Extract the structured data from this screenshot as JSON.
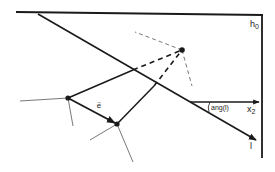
{
  "diagram": {
    "labels": {
      "h0": "h",
      "h0_sub": "0",
      "x2": "x",
      "x2_sub": "2",
      "line_l": "l",
      "angle": "ang(l)",
      "vector_e": "e",
      "vector_arrow": "→"
    },
    "colors": {
      "ink": "#1a1a1a",
      "thin": "#555555",
      "background": "#ffffff"
    }
  }
}
